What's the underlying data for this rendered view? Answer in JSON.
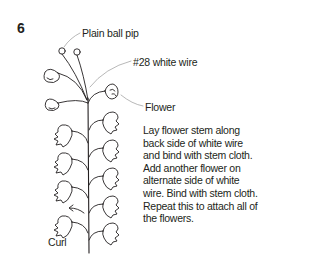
{
  "step": {
    "number": "6"
  },
  "labels": {
    "pip": "Plain ball pip",
    "wire": "#28 white wire",
    "flower": "Flower",
    "curl": "Curl"
  },
  "instructions": "Lay flower stem along back side of white wire and bind with stem cloth. Add another flower on alternate side of white wire. Bind with stem cloth. Repeat this to attach all of the flowers.",
  "illustration": {
    "subject": "lily-of-the-valley style wired flower spray",
    "icons": [
      "ball-pip-icon",
      "bell-flower-icon",
      "stem-icon",
      "curl-arrow-icon",
      "leader-line"
    ]
  },
  "colors": {
    "ink": "#231f20",
    "leader_line": "#9a9a9a",
    "background": "#ffffff"
  }
}
